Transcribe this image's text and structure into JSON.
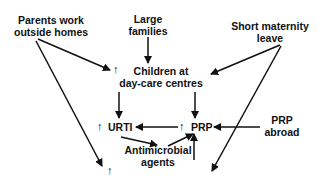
{
  "nodes": {
    "parents": {
      "line1": "Parents work",
      "line2": "outside homes"
    },
    "large_families": {
      "line1": "Large",
      "line2": "families"
    },
    "short_maternity": {
      "line1": "Short maternity",
      "line2": "leave"
    },
    "children": {
      "line1": "Children at",
      "line2": "day-care centres"
    },
    "urti": {
      "label": "URTI"
    },
    "prp": {
      "label": "PRP"
    },
    "prp_abroad": {
      "line1": "PRP",
      "line2": "abroad"
    },
    "antimicrobial": {
      "line1": "Antimicrobial",
      "line2": "agents"
    }
  },
  "increase_marker": "↑",
  "colors": {
    "ink": "#111111",
    "background": "#ffffff"
  }
}
